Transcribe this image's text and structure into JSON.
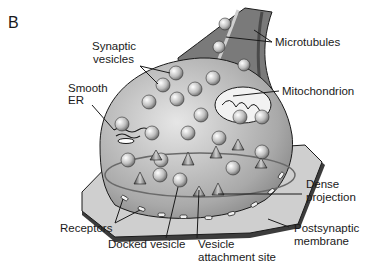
{
  "panel_label": "B",
  "diagram": {
    "labels": {
      "synaptic_vesicles": [
        "Synaptic",
        "vesicles"
      ],
      "smooth_er": [
        "Smooth",
        "ER"
      ],
      "microtubules": "Microtubules",
      "mitochondrion": "Mitochondrion",
      "dense_projection": [
        "Dense",
        "projection"
      ],
      "postsynaptic_membrane": [
        "Postsynaptic",
        "membrane"
      ],
      "receptors": "Receptors",
      "docked_vesicle": "Docked vesicle",
      "vesicle_attachment_site": [
        "Vesicle",
        "attachment site"
      ]
    },
    "colors": {
      "terminal_fill": "#b8b8b8",
      "terminal_dark": "#6e6e6e",
      "membrane_fill": "#c9c9c9",
      "vesicle_fill": "#d8d8d8",
      "outline": "#1a1a1a"
    }
  }
}
